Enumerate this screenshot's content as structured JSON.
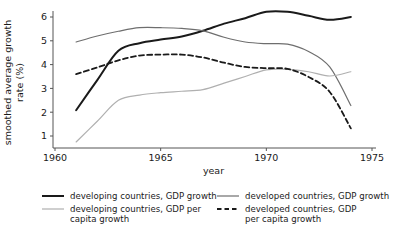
{
  "chart_data": {
    "type": "line",
    "title": "",
    "xlabel": "year",
    "ylabel": "smoothed average growth rate (%)",
    "xlim": [
      1960,
      1975
    ],
    "ylim": [
      0.5,
      6.5
    ],
    "xticks": [
      "1960",
      "1965",
      "1970",
      "1975"
    ],
    "xtick_values": [
      1960,
      1965,
      1970,
      1975
    ],
    "yticks": [
      "1",
      "2",
      "3",
      "4",
      "5",
      "6"
    ],
    "ytick_values": [
      1,
      2,
      3,
      4,
      5,
      6
    ],
    "grid": false,
    "legend_position": "below",
    "x": [
      1961,
      1962,
      1963,
      1964,
      1965,
      1966,
      1967,
      1968,
      1969,
      1970,
      1971,
      1972,
      1973,
      1974
    ],
    "series": [
      {
        "name": "developing countries, GDP growth",
        "style": "solid",
        "color": "#1a1a1a",
        "width": 2.0,
        "values": [
          2.08,
          3.35,
          4.58,
          4.9,
          5.05,
          5.18,
          5.42,
          5.72,
          5.95,
          6.22,
          6.22,
          6.05,
          5.88,
          6.0
        ]
      },
      {
        "name": "developed countries, GDP growth",
        "style": "solid",
        "color": "#6e6e6e",
        "width": 1.2,
        "values": [
          4.95,
          5.2,
          5.4,
          5.55,
          5.55,
          5.52,
          5.42,
          5.15,
          4.95,
          4.88,
          4.86,
          4.55,
          3.9,
          2.28
        ]
      },
      {
        "name": "developing countries, GDP per capita growth",
        "style": "solid",
        "color": "#b0b0b0",
        "width": 1.2,
        "values": [
          0.75,
          1.62,
          2.5,
          2.72,
          2.82,
          2.88,
          2.95,
          3.22,
          3.5,
          3.78,
          3.8,
          3.7,
          3.52,
          3.7
        ]
      },
      {
        "name": "developed countries, GDP per capita growth",
        "style": "dashed",
        "color": "#1a1a1a",
        "width": 1.8,
        "values": [
          3.6,
          3.88,
          4.18,
          4.38,
          4.42,
          4.42,
          4.3,
          4.08,
          3.9,
          3.85,
          3.82,
          3.48,
          2.85,
          1.32
        ]
      }
    ],
    "legend": [
      {
        "label": "developing countries, GDP growth",
        "style": "solid",
        "color": "#1a1a1a",
        "width": 2.0
      },
      {
        "label": "developed countries, GDP growth",
        "style": "solid",
        "color": "#6e6e6e",
        "width": 1.2
      },
      {
        "label_line1": "developing countries, GDP per",
        "label_line2": "capita growth",
        "style": "solid",
        "color": "#b0b0b0",
        "width": 1.2
      },
      {
        "label_line1": "developed countries, GDP",
        "label_line2": "per capita growth",
        "style": "dashed",
        "color": "#1a1a1a",
        "width": 1.8
      }
    ]
  }
}
